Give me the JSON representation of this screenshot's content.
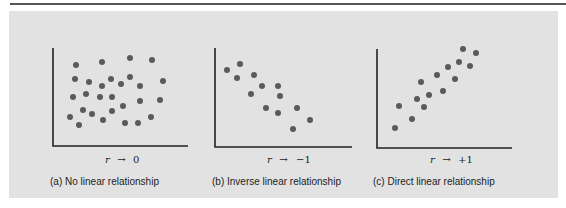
{
  "chart_data": [
    {
      "type": "scatter",
      "title": "(a) No linear relationship",
      "annotation": "r → 0",
      "xlabel": "",
      "ylabel": "",
      "grid": false,
      "points": [
        [
          76,
          65
        ],
        [
          102,
          62
        ],
        [
          130,
          58
        ],
        [
          152,
          60
        ],
        [
          75,
          79
        ],
        [
          89,
          82
        ],
        [
          102,
          86
        ],
        [
          111,
          79
        ],
        [
          121,
          84
        ],
        [
          130,
          77
        ],
        [
          140,
          86
        ],
        [
          163,
          81
        ],
        [
          73,
          97
        ],
        [
          86,
          94
        ],
        [
          100,
          97
        ],
        [
          112,
          97
        ],
        [
          123,
          106
        ],
        [
          140,
          101
        ],
        [
          160,
          100
        ],
        [
          83,
          110
        ],
        [
          92,
          114
        ],
        [
          103,
          120
        ],
        [
          112,
          111
        ],
        [
          125,
          123
        ],
        [
          138,
          123
        ],
        [
          151,
          117
        ],
        [
          70,
          117
        ],
        [
          79,
          125
        ]
      ]
    },
    {
      "type": "scatter",
      "title": "(b) Inverse linear relationship",
      "annotation": "r → −1",
      "xlabel": "",
      "ylabel": "",
      "grid": false,
      "points": [
        [
          227,
          70
        ],
        [
          240,
          64
        ],
        [
          237,
          78
        ],
        [
          254,
          75
        ],
        [
          262,
          86
        ],
        [
          278,
          86
        ],
        [
          251,
          94
        ],
        [
          280,
          96
        ],
        [
          266,
          108
        ],
        [
          278,
          113
        ],
        [
          297,
          108
        ],
        [
          310,
          120
        ],
        [
          293,
          129
        ]
      ]
    },
    {
      "type": "scatter",
      "title": "(c) Direct linear relationship",
      "annotation": "r → +1",
      "xlabel": "",
      "ylabel": "",
      "grid": false,
      "points": [
        [
          395,
          128
        ],
        [
          412,
          119
        ],
        [
          399,
          106
        ],
        [
          424,
          107
        ],
        [
          417,
          99
        ],
        [
          429,
          95
        ],
        [
          421,
          82
        ],
        [
          443,
          91
        ],
        [
          437,
          75
        ],
        [
          455,
          79
        ],
        [
          448,
          67
        ],
        [
          459,
          62
        ],
        [
          470,
          66
        ],
        [
          463,
          49
        ],
        [
          476,
          53
        ]
      ]
    }
  ],
  "panels": [
    {
      "rlabel": "r",
      "arrow": "→",
      "rvalue": "0",
      "caption": "(a) No linear relationship"
    },
    {
      "rlabel": "r",
      "arrow": "→",
      "rvalue": "−1",
      "caption": "(b) Inverse linear relationship"
    },
    {
      "rlabel": "r",
      "arrow": "→",
      "rvalue": "+1",
      "caption": "(c) Direct linear relationship"
    }
  ]
}
